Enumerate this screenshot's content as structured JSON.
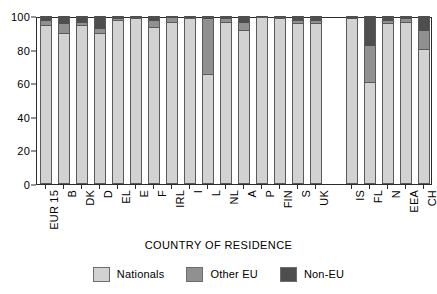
{
  "chart_data": {
    "type": "bar",
    "subtype": "stacked-percentage-column",
    "title": "",
    "xlabel": "COUNTRY OF RESIDENCE",
    "ylabel": "",
    "ylim": [
      0,
      100
    ],
    "yticks": [
      0,
      20,
      40,
      60,
      80,
      100
    ],
    "grid": false,
    "legend_position": "bottom-center",
    "categories": [
      "EUR 15",
      "B",
      "DK",
      "D",
      "EL",
      "E",
      "F",
      "IRL",
      "I",
      "L",
      "NL",
      "A",
      "P",
      "FIN",
      "S",
      "UK",
      "IS",
      "FL",
      "N",
      "EEA",
      "CH"
    ],
    "group_gap_after": "UK",
    "series": [
      {
        "name": "Nationals",
        "color": "#d2d2d2",
        "values": [
          94,
          89,
          94,
          89,
          97,
          98,
          93,
          96,
          98,
          65,
          96,
          91,
          99,
          98,
          95,
          95,
          98,
          60,
          95,
          96,
          80
        ]
      },
      {
        "name": "Other EU",
        "color": "#909090",
        "values": [
          3,
          6,
          2,
          3,
          1,
          1,
          4,
          3,
          1,
          33,
          2,
          5,
          0.5,
          1,
          2,
          2,
          0.5,
          22,
          2,
          2,
          11
        ]
      },
      {
        "name": "Non-EU",
        "color": "#4e4e4e",
        "values": [
          3,
          5,
          4,
          8,
          2,
          1,
          3,
          1,
          1,
          2,
          2,
          4,
          0.5,
          1,
          3,
          3,
          1.5,
          18,
          3,
          2,
          9
        ]
      }
    ]
  },
  "legend": {
    "items": [
      {
        "label": "Nationals",
        "color": "#d2d2d2"
      },
      {
        "label": "Other EU",
        "color": "#909090"
      },
      {
        "label": "Non-EU",
        "color": "#4e4e4e"
      }
    ]
  },
  "axis": {
    "x_title": "COUNTRY OF RESIDENCE"
  }
}
